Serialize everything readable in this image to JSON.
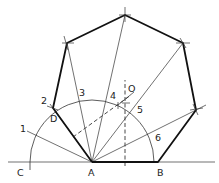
{
  "diagram": {
    "points": {
      "A": "A",
      "B": "B",
      "C": "C",
      "D": "D",
      "O": "O"
    },
    "division_labels": [
      "1",
      "2",
      "3",
      "4",
      "5",
      "6"
    ],
    "polygon_sides": 7
  }
}
